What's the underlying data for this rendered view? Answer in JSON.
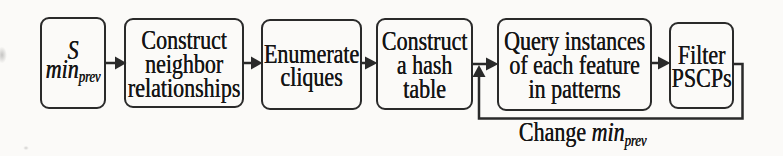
{
  "diagram": {
    "colors": {
      "background": "#fbfaf8",
      "line": "#2a2a2a",
      "text": "#151515"
    },
    "start_box": {
      "symbol": "S",
      "param": "min",
      "param_sub": "prev"
    },
    "steps": [
      {
        "name": "construct-neighbor-relationships",
        "lines": [
          "Construct",
          "neighbor",
          "relationships"
        ]
      },
      {
        "name": "enumerate-cliques",
        "lines": [
          "Enumerate",
          "cliques"
        ]
      },
      {
        "name": "construct-hash-table",
        "lines": [
          "Construct",
          "a hash",
          "table"
        ]
      },
      {
        "name": "query-instances",
        "lines": [
          "Query instances",
          "of each feature",
          "in patterns"
        ]
      },
      {
        "name": "filter-pscps",
        "lines": [
          "Filter",
          "PSCPs"
        ]
      }
    ],
    "feedback_label": {
      "prefix": "Change ",
      "param": "min",
      "param_sub": "prev"
    },
    "connectors": [
      {
        "from": "start",
        "to": "construct-neighbor-relationships",
        "type": "arrow"
      },
      {
        "from": "construct-neighbor-relationships",
        "to": "enumerate-cliques",
        "type": "arrow"
      },
      {
        "from": "enumerate-cliques",
        "to": "construct-hash-table",
        "type": "arrow"
      },
      {
        "from": "construct-hash-table",
        "to": "query-instances",
        "type": "arrow"
      },
      {
        "from": "query-instances",
        "to": "filter-pscps",
        "type": "arrow"
      },
      {
        "from": "filter-pscps",
        "to": "junction-before-query-instances",
        "type": "feedback",
        "label": "Change min_prev"
      }
    ]
  }
}
